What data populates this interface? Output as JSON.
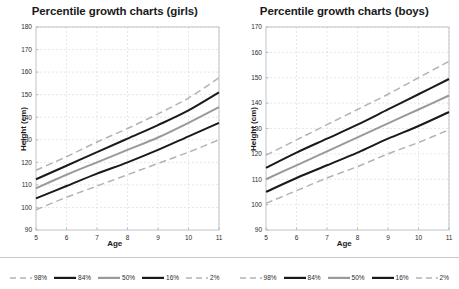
{
  "chart_data": [
    {
      "type": "line",
      "title": "Percentile growth charts (girls)",
      "xlabel": "Age",
      "ylabel": "Height (cm)",
      "xlim": [
        5,
        11
      ],
      "ylim": [
        90,
        180
      ],
      "xticks": [
        5,
        6,
        7,
        8,
        9,
        10,
        11
      ],
      "yticks": [
        90,
        100,
        110,
        120,
        130,
        140,
        150,
        160,
        170,
        180
      ],
      "grid": true,
      "legend_position": "bottom",
      "x": [
        5,
        6,
        7,
        8,
        9,
        10,
        11
      ],
      "series": [
        {
          "name": "98%",
          "style": "dashed",
          "color": "#b3b3b3",
          "values": [
            116.5,
            122.5,
            129.0,
            135.0,
            141.5,
            148.5,
            157.5
          ]
        },
        {
          "name": "84%",
          "style": "solid",
          "color": "#1a1a1a",
          "values": [
            112.5,
            118.5,
            124.5,
            130.5,
            136.5,
            143.0,
            151.0
          ]
        },
        {
          "name": "50%",
          "style": "solid",
          "color": "#999999",
          "values": [
            108.5,
            114.5,
            120.0,
            125.5,
            131.0,
            137.5,
            144.5
          ]
        },
        {
          "name": "16%",
          "style": "solid",
          "color": "#1a1a1a",
          "values": [
            104.0,
            109.5,
            115.0,
            120.0,
            125.5,
            131.5,
            137.5
          ]
        },
        {
          "name": "2%",
          "style": "dashed",
          "color": "#b3b3b3",
          "values": [
            99.0,
            104.5,
            109.5,
            114.5,
            119.5,
            124.5,
            130.0
          ]
        }
      ]
    },
    {
      "type": "line",
      "title": "Percentile growth charts (boys)",
      "xlabel": "Age",
      "ylabel": "Height (cm)",
      "xlim": [
        5,
        11
      ],
      "ylim": [
        90,
        170
      ],
      "xticks": [
        5,
        6,
        7,
        8,
        9,
        10,
        11
      ],
      "yticks": [
        90,
        100,
        110,
        120,
        130,
        140,
        150,
        160,
        170
      ],
      "grid": true,
      "legend_position": "bottom",
      "x": [
        5,
        6,
        7,
        8,
        9,
        10,
        11
      ],
      "series": [
        {
          "name": "98%",
          "style": "dashed",
          "color": "#b3b3b3",
          "values": [
            119.5,
            125.5,
            131.5,
            137.5,
            143.5,
            150.0,
            156.5
          ]
        },
        {
          "name": "84%",
          "style": "solid",
          "color": "#1a1a1a",
          "values": [
            114.5,
            120.5,
            126.0,
            131.5,
            137.5,
            143.5,
            149.5
          ]
        },
        {
          "name": "50%",
          "style": "solid",
          "color": "#999999",
          "values": [
            110.0,
            115.5,
            121.0,
            126.5,
            132.0,
            137.5,
            143.0
          ]
        },
        {
          "name": "16%",
          "style": "solid",
          "color": "#1a1a1a",
          "values": [
            105.0,
            110.5,
            115.5,
            120.5,
            126.0,
            131.0,
            136.5
          ]
        },
        {
          "name": "2%",
          "style": "dashed",
          "color": "#b3b3b3",
          "values": [
            100.5,
            105.5,
            110.5,
            115.0,
            120.0,
            124.5,
            129.5
          ]
        }
      ]
    }
  ],
  "legend": {
    "entries": [
      {
        "label": "98%",
        "style": "dashed",
        "color": "#b3b3b3"
      },
      {
        "label": "84%",
        "style": "solid",
        "color": "#1a1a1a"
      },
      {
        "label": "50%",
        "style": "solid",
        "color": "#999999"
      },
      {
        "label": "16%",
        "style": "solid",
        "color": "#1a1a1a"
      },
      {
        "label": "2%",
        "style": "dashed",
        "color": "#b3b3b3"
      }
    ]
  },
  "style": {
    "grid_color": "#d9dde2",
    "axis_color": "#b0b4b8",
    "background": "#ffffff",
    "text_color": "#1a1a1a"
  }
}
